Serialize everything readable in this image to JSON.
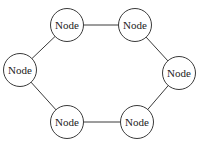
{
  "diagram": {
    "type": "ring-topology",
    "background_color": "#ffffff",
    "node_fill_color": "#ffffff",
    "stroke_color": "#3a3a3a",
    "label_color": "#222222",
    "node_radius": 16.5,
    "nodes": [
      {
        "id": "node-top-left",
        "label": "Node",
        "x": 67,
        "y": 25
      },
      {
        "id": "node-top-right",
        "label": "Node",
        "x": 135,
        "y": 25
      },
      {
        "id": "node-right",
        "label": "Node",
        "x": 179,
        "y": 73
      },
      {
        "id": "node-bottom-right",
        "label": "Node",
        "x": 137,
        "y": 122
      },
      {
        "id": "node-bottom-left",
        "label": "Node",
        "x": 67,
        "y": 122
      },
      {
        "id": "node-left",
        "label": "Node",
        "x": 20,
        "y": 70
      }
    ],
    "edges": [
      {
        "from": 0,
        "to": 1
      },
      {
        "from": 1,
        "to": 2
      },
      {
        "from": 2,
        "to": 3
      },
      {
        "from": 3,
        "to": 4
      },
      {
        "from": 4,
        "to": 5
      },
      {
        "from": 5,
        "to": 0
      }
    ]
  }
}
